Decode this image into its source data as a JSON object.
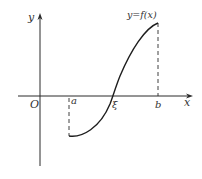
{
  "figure": {
    "type": "function-graph",
    "axes": {
      "x_label": "x",
      "y_label": "y",
      "origin_label": "O"
    },
    "points": {
      "a": "a",
      "xi": "ξ",
      "b": "b"
    },
    "curve_label": "y=f(x)",
    "colors": {
      "stroke": "#2a2a2a",
      "text": "#333333",
      "background": "#ffffff"
    }
  }
}
